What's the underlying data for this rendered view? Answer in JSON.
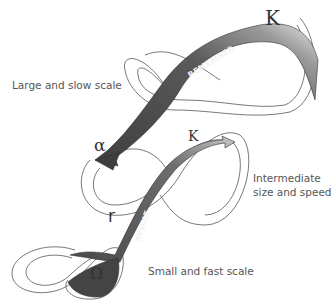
{
  "diagram": {
    "type": "panarchy",
    "scales": [
      {
        "id": "large",
        "label": "Large and slow scale"
      },
      {
        "id": "intermediate",
        "label_line1": "Intermediate",
        "label_line2": "size and speed"
      },
      {
        "id": "small",
        "label": "Small and fast scale"
      }
    ],
    "arrows": [
      {
        "id": "remember",
        "label": "REMEMBER",
        "from": "large K",
        "to": "intermediate alpha"
      },
      {
        "id": "revolt",
        "label": "REVOLT",
        "from": "small Omega",
        "to": "intermediate K"
      }
    ],
    "symbols": {
      "large_K": "K",
      "intermediate_K": "K",
      "alpha": "α",
      "r": "r",
      "omega": "Ω"
    },
    "colors": {
      "ribbon_dark": "#4a4a4a",
      "ribbon_mid": "#7a7a7a",
      "ribbon_light": "#e6e6e6",
      "outline": "#555555"
    }
  }
}
